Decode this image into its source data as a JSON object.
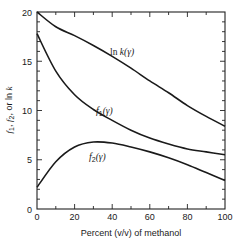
{
  "chart_data": {
    "type": "line",
    "title": "",
    "xlabel": "Percent (v/v) of methanol",
    "ylabel": "f1, f2, or ln k",
    "xlim": [
      0,
      100
    ],
    "ylim": [
      0,
      20
    ],
    "x_ticks": [
      "0",
      "20",
      "40",
      "60",
      "80",
      "100"
    ],
    "y_ticks": [
      "0",
      "5",
      "10",
      "15",
      "20"
    ],
    "grid": false,
    "legend": "inline labels",
    "x": [
      0,
      10,
      20,
      30,
      40,
      50,
      60,
      70,
      80,
      90,
      100
    ],
    "series": [
      {
        "name": "ln k(γ)",
        "label_parts": {
          "main": "ln ",
          "italic": "k",
          "arg": "(γ)"
        },
        "values": [
          20.0,
          18.5,
          17.6,
          16.6,
          15.5,
          14.3,
          13.0,
          11.8,
          10.5,
          9.4,
          8.4
        ]
      },
      {
        "name": "f1(γ)",
        "label_parts": {
          "main": "f",
          "sub": "1",
          "arg": "(γ)"
        },
        "values": [
          17.8,
          14.0,
          11.6,
          10.1,
          9.0,
          8.0,
          7.2,
          6.6,
          6.1,
          5.8,
          5.5
        ]
      },
      {
        "name": "f2(γ)",
        "label_parts": {
          "main": "f",
          "sub": "2",
          "arg": "(γ)"
        },
        "values": [
          2.2,
          4.8,
          6.3,
          6.8,
          6.7,
          6.3,
          5.8,
          5.2,
          4.5,
          3.7,
          2.9
        ]
      }
    ]
  },
  "axes": {
    "xlabel": "Percent (v/v) of methanol",
    "ylabel_parts": [
      "f",
      "1",
      ", ",
      "f",
      "2",
      ", or ln ",
      "k"
    ]
  }
}
